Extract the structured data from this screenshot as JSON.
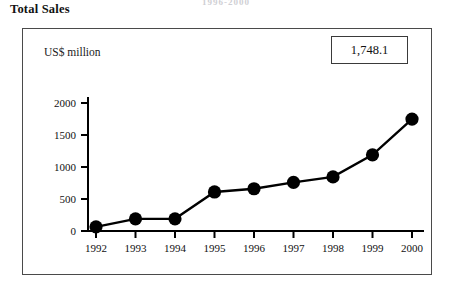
{
  "page": {
    "title": "Total Sales",
    "top_cut_text": "1996-2000"
  },
  "callout": {
    "value_label": "1,748.1"
  },
  "chart_data": {
    "type": "line",
    "title": "Total Sales",
    "xlabel": "",
    "ylabel": "US$ million",
    "ylim": [
      0,
      2200
    ],
    "yticks": [
      0,
      500,
      1000,
      1500,
      2000
    ],
    "ytick_labels": [
      "0",
      "500",
      "1000",
      "1500",
      "2000"
    ],
    "categories": [
      "1992",
      "1993",
      "1994",
      "1995",
      "1996",
      "1997",
      "1998",
      "1999",
      "2000"
    ],
    "values": [
      65,
      190,
      190,
      610,
      660,
      760,
      845,
      1190,
      1748.1
    ],
    "grid": false,
    "legend": false,
    "marker": "filled-circle",
    "line_color": "#000000",
    "marker_color": "#000000",
    "annotations": [
      {
        "text": "1,748.1",
        "target_category": "2000",
        "kind": "callout-box"
      }
    ]
  }
}
